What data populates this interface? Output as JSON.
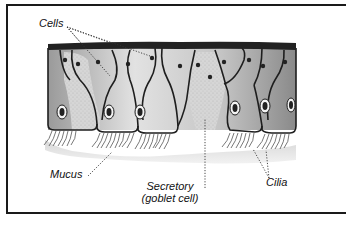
{
  "diagram": {
    "title": "",
    "labels": {
      "cells": "Cells",
      "mucus": "Mucus",
      "secretory_line1": "Secretory",
      "secretory_line2": "(goblet cell)",
      "cilia": "Cilia"
    },
    "colors": {
      "frame": "#1a1a1a",
      "cell_outline": "#1e1e1e",
      "cell_fill": "#c8c8c8",
      "goblet_fill": "#d4d4d4",
      "surface_band": "#222222",
      "mucus": "#e6e6e6",
      "text": "#111111"
    }
  }
}
